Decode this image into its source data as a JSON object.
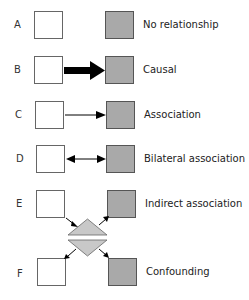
{
  "rows": [
    {
      "letter": "A",
      "label": "No relationship"
    },
    {
      "letter": "B",
      "label": "Causal"
    },
    {
      "letter": "C",
      "label": "Association"
    },
    {
      "letter": "D",
      "label": "Bilateral association"
    },
    {
      "letter": "E",
      "label": "Indirect association"
    },
    {
      "letter": "F",
      "label": "Confounding"
    }
  ],
  "colors": {
    "exposure_box": "#ffffff",
    "outcome_box": "#a9a9a9",
    "third_factor": "#c8c8c8",
    "arrow": "#000000"
  }
}
